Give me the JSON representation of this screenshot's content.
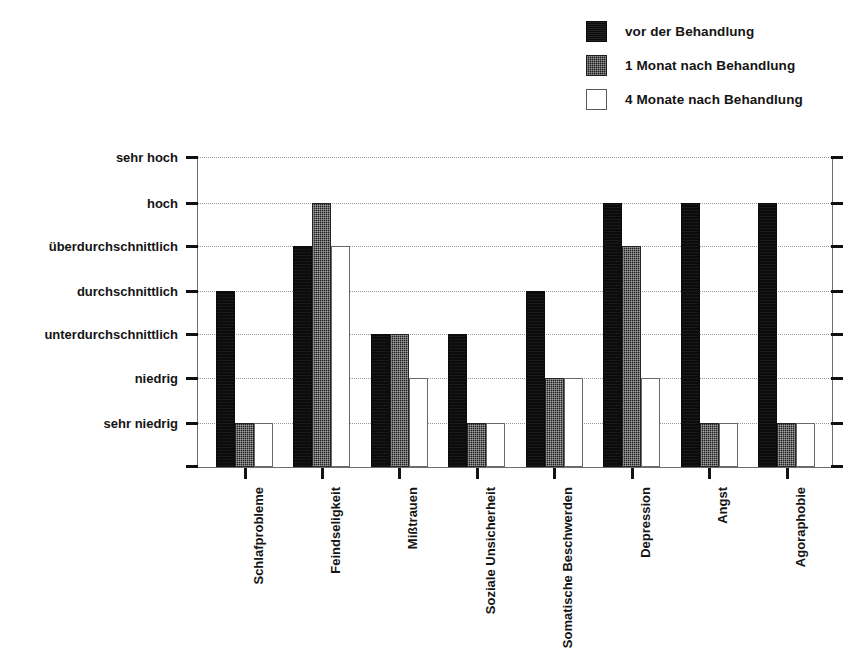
{
  "legend": {
    "position": "top-right",
    "items": [
      {
        "label": "vor der Behandlung",
        "swatch": "solid-black-square-icon",
        "color": "#0b0b0b"
      },
      {
        "label": "1 Monat nach Behandlung",
        "swatch": "dark-hatched-square-icon",
        "color": "#1e1e1e"
      },
      {
        "label": "4 Monate nach Behandlung",
        "swatch": "white-outlined-square-icon",
        "color": "#ffffff"
      }
    ]
  },
  "chart_data": {
    "type": "bar",
    "title": "",
    "subtitle": "",
    "xlabel": "",
    "ylabel": "",
    "grid": true,
    "legend_position": "top-right",
    "categories": [
      "Schlafprobleme",
      "Feindseligkeit",
      "Mißtrauen",
      "Soziale Unsicherheit",
      "Somatische Beschwerden",
      "Depression",
      "Angst",
      "Agoraphobie"
    ],
    "y_tick_labels": [
      "sehr hoch",
      "hoch",
      "überdurchschnittlich",
      "durchschnittlich",
      "unterdurchschnittlich",
      "niedrig",
      "sehr niedrig"
    ],
    "y_scale_values": [
      7,
      6,
      5,
      4,
      3,
      2,
      1
    ],
    "ylim": [
      0,
      7
    ],
    "series": [
      {
        "name": "vor der Behandlung",
        "color": "#0b0b0b",
        "values": [
          4,
          5,
          3,
          3,
          4,
          6,
          6,
          6
        ],
        "value_labels": [
          "durchschnittlich",
          "überdurchschnittlich",
          "unterdurchschnittlich",
          "unterdurchschnittlich",
          "durchschnittlich",
          "hoch",
          "hoch",
          "hoch"
        ]
      },
      {
        "name": "1 Monat nach Behandlung",
        "color": "#1e1e1e",
        "values": [
          1,
          6,
          3,
          1,
          2,
          5,
          1,
          1
        ],
        "value_labels": [
          "sehr niedrig",
          "hoch",
          "unterdurchschnittlich",
          "sehr niedrig",
          "niedrig",
          "überdurchschnittlich",
          "sehr niedrig",
          "sehr niedrig"
        ]
      },
      {
        "name": "4 Monate nach Behandlung",
        "color": "#ffffff",
        "values": [
          1,
          5,
          2,
          1,
          2,
          2,
          1,
          1
        ],
        "value_labels": [
          "sehr niedrig",
          "überdurchschnittlich",
          "niedrig",
          "sehr niedrig",
          "niedrig",
          "niedrig",
          "sehr niedrig",
          "sehr niedrig"
        ]
      }
    ]
  }
}
